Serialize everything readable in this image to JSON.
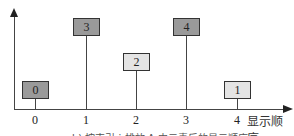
{
  "diagram": {
    "x_axis_label": "显示顺序",
    "caption": "b) 按索引 i 排放 A 中元素后的显示顺序",
    "ticks": [
      "0",
      "1",
      "2",
      "3",
      "4"
    ],
    "items": [
      {
        "position": 0,
        "value": "0",
        "shade": "dark",
        "height_level": "low"
      },
      {
        "position": 1,
        "value": "3",
        "shade": "dark",
        "height_level": "high"
      },
      {
        "position": 2,
        "value": "2",
        "shade": "light",
        "height_level": "mid"
      },
      {
        "position": 3,
        "value": "4",
        "shade": "dark",
        "height_level": "high"
      },
      {
        "position": 4,
        "value": "1",
        "shade": "light",
        "height_level": "low"
      }
    ]
  }
}
